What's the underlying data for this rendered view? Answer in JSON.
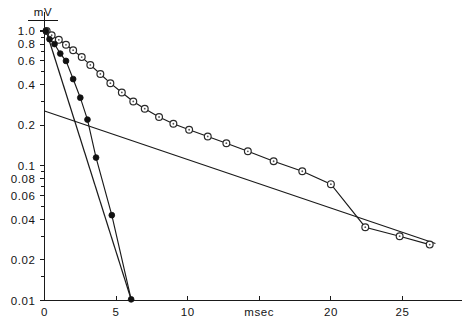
{
  "chart_data": {
    "type": "scatter",
    "title": "",
    "subtitle": "",
    "xlabel": "msec",
    "ylabel": "mV",
    "yscale": "log",
    "xscale": "linear",
    "grid": false,
    "legend": "none",
    "xlim": [
      0,
      27.5
    ],
    "ylim": [
      0.01,
      1.1
    ],
    "xticks": [
      0,
      5,
      10,
      15,
      20,
      25
    ],
    "xtick_labels": [
      "0",
      "5",
      "10",
      "msec",
      "20",
      "25"
    ],
    "yticks": [
      1.0,
      0.8,
      0.6,
      0.4,
      0.2,
      0.1,
      0.08,
      0.06,
      0.04,
      0.02,
      0.01
    ],
    "ytick_labels": [
      "1.0",
      "0.8",
      "0.6",
      "0.4",
      "0.2",
      "0.1",
      "0.08",
      "0.06",
      "0.04",
      "0.02",
      "0.01"
    ],
    "yminor_ticks": [
      0.9,
      0.7,
      0.5,
      0.3,
      0.09,
      0.07,
      0.05,
      0.03,
      0.015
    ],
    "series": [
      {
        "name": "slow-component-open-circles",
        "marker": "open-circle",
        "connected": true,
        "x": [
          0.15,
          0.5,
          1.0,
          1.5,
          2.0,
          2.6,
          3.2,
          3.9,
          4.6,
          5.4,
          6.2,
          7.0,
          8.0,
          9.0,
          10.1,
          11.4,
          12.7,
          14.2,
          16.0,
          18.0,
          20.0,
          22.4,
          24.8,
          26.9
        ],
        "y": [
          1.0,
          0.93,
          0.86,
          0.79,
          0.72,
          0.64,
          0.56,
          0.48,
          0.41,
          0.35,
          0.3,
          0.265,
          0.23,
          0.205,
          0.185,
          0.165,
          0.147,
          0.128,
          0.108,
          0.091,
          0.073,
          0.035,
          0.03,
          0.026
        ]
      },
      {
        "name": "fast-component-filled-circles",
        "marker": "filled-circle",
        "connected": true,
        "x": [
          0.1,
          0.35,
          0.7,
          1.1,
          1.5,
          2.0,
          2.5,
          3.0,
          3.6,
          4.7,
          6.05
        ],
        "y": [
          1.0,
          0.87,
          0.8,
          0.68,
          0.6,
          0.44,
          0.32,
          0.22,
          0.115,
          0.043,
          0.0102
        ]
      }
    ],
    "fit_lines": [
      {
        "name": "slow-exponential-fit",
        "x0": 0.0,
        "y0": 0.255,
        "x1": 27.3,
        "y1": 0.0265
      },
      {
        "name": "fast-exponential-fit",
        "x0": 0.12,
        "y0": 1.0,
        "x1": 6.05,
        "y1": 0.0102
      }
    ],
    "annotations": []
  },
  "axes": {
    "y_unit_label": "mV",
    "x_unit_label": "msec"
  }
}
